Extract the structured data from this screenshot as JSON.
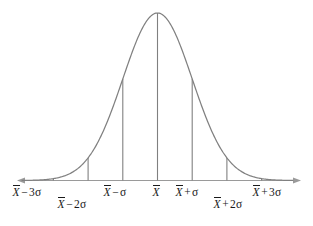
{
  "figure": {
    "width": 313,
    "height": 226,
    "background_color": "#ffffff",
    "curve_color": "#808080",
    "tick_color": "#808080",
    "axis_color": "#9a9a9a",
    "label_color": "#1a1a1a"
  },
  "chart_data": {
    "type": "line",
    "title": "",
    "xlabel": "",
    "ylabel": "",
    "grid": false,
    "legend": null,
    "axis_arrows": "both",
    "x": [
      -3,
      -2,
      -1,
      0,
      1,
      2,
      3
    ],
    "tick_labels": [
      "X̄ − 3σ",
      "X̄ − 2σ",
      "X̄ − σ",
      "X̄",
      "X̄ + σ",
      "X̄ + 2σ",
      "X̄ + 2σ",
      "X̄ + 3σ"
    ],
    "series": [
      {
        "name": "normal density",
        "description": "Gaussian bell curve, mean 0, standard deviation 1",
        "values": [
          0.0111,
          0.1353,
          0.6065,
          1.0,
          0.6065,
          0.1353,
          0.0111
        ]
      }
    ],
    "ordinates": [
      {
        "x": -3,
        "label": "X̄ − 3σ",
        "height_fraction": 0.011
      },
      {
        "x": -2,
        "label": "X̄ − 2σ",
        "height_fraction": 0.135
      },
      {
        "x": -1,
        "label": "X̄ − σ",
        "height_fraction": 0.607
      },
      {
        "x": 0,
        "label": "X̄",
        "height_fraction": 1.0
      },
      {
        "x": 1,
        "label": "X̄ + σ",
        "height_fraction": 0.607
      },
      {
        "x": 2,
        "label": "X̄ + 2σ",
        "height_fraction": 0.135
      },
      {
        "x": 3,
        "label": "X̄ + 3σ",
        "height_fraction": 0.011
      }
    ],
    "xlim": [
      -3.9,
      3.9
    ],
    "ylim": [
      0,
      1.06
    ]
  },
  "labels": [
    {
      "id": "minus-3-sigma",
      "base": "X",
      "op": "−",
      "coef": "3",
      "sigma": "σ",
      "row": "upper"
    },
    {
      "id": "minus-2-sigma",
      "base": "X",
      "op": "−",
      "coef": "2",
      "sigma": "σ",
      "row": "lower"
    },
    {
      "id": "minus-1-sigma",
      "base": "X",
      "op": "−",
      "coef": "",
      "sigma": "σ",
      "row": "upper"
    },
    {
      "id": "mean",
      "base": "X",
      "op": "",
      "coef": "",
      "sigma": "",
      "row": "upper"
    },
    {
      "id": "plus-1-sigma",
      "base": "X",
      "op": "+",
      "coef": "",
      "sigma": "σ",
      "row": "upper"
    },
    {
      "id": "plus-2-sigma",
      "base": "X",
      "op": "+",
      "coef": "2",
      "sigma": "σ",
      "row": "lower"
    },
    {
      "id": "plus-3-sigma",
      "base": "X",
      "op": "+",
      "coef": "3",
      "sigma": "σ",
      "row": "upper"
    }
  ]
}
